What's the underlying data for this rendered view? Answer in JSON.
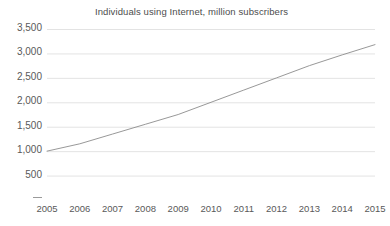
{
  "chart_data": {
    "type": "line",
    "title": "Individuals using Internet, million subscribers",
    "xlabel": "",
    "ylabel": "",
    "categories": [
      "2005",
      "2006",
      "2007",
      "2008",
      "2009",
      "2010",
      "2011",
      "2012",
      "2013",
      "2014",
      "2015"
    ],
    "x": [
      2005,
      2006,
      2007,
      2008,
      2009,
      2010,
      2011,
      2012,
      2013,
      2014,
      2015
    ],
    "values": [
      1000,
      1150,
      1350,
      1550,
      1750,
      2000,
      2250,
      2500,
      2750,
      2970,
      3180
    ],
    "series": [
      {
        "name": "Individuals using Internet",
        "values": [
          1000,
          1150,
          1350,
          1550,
          1750,
          2000,
          2250,
          2500,
          2750,
          2970,
          3180
        ],
        "color": "#8c8c8c"
      }
    ],
    "ylim": [
      0,
      3500
    ],
    "y_ticks": [
      500,
      1000,
      1500,
      2000,
      2500,
      3000,
      3500
    ],
    "y_tick_labels": [
      "500",
      "1,000",
      "1,500",
      "2,000",
      "2,500",
      "3,000",
      "3,500"
    ],
    "grid": true,
    "grid_axis": "y",
    "legend": false,
    "legend_position": "none",
    "markers": false
  },
  "colors": {
    "background": "#ffffff",
    "line": "#8c8c8c",
    "grid": "#e3e3e3",
    "text": "#595959",
    "title_text": "#4d4d4d",
    "axis_stub": "#9a9a9a"
  },
  "axis": {
    "zero_tick_label": ""
  }
}
